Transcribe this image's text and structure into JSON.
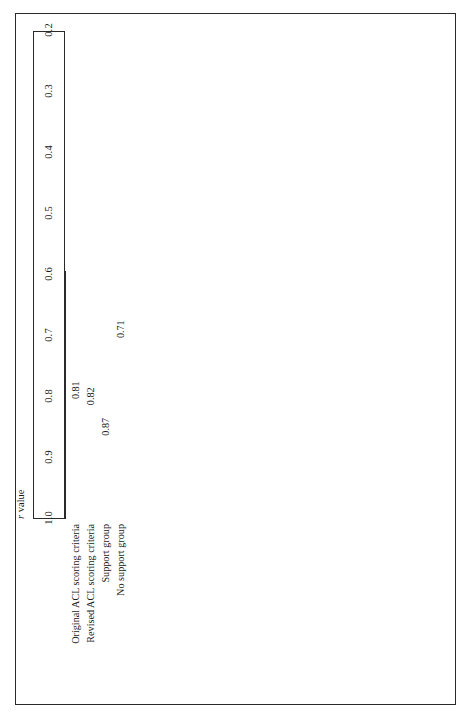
{
  "figure": {
    "orientation": "rotated-90-ccw",
    "background": "#ffffff",
    "frame_color": "#2a2a2a"
  },
  "chart_data": {
    "type": "bar",
    "title": "",
    "subtitle": "",
    "xlabel": "r value",
    "ylabel": "",
    "orientation": "horizontal",
    "categories": [
      "Original ACL scoring criteria",
      "Revised ACL scoring criteria",
      "Support group",
      "No support group"
    ],
    "values": [
      0.81,
      0.82,
      0.87,
      0.71
    ],
    "value_labels": [
      "0.81",
      "0.82",
      "0.87",
      "0.71"
    ],
    "xlim": [
      1.0,
      0.2
    ],
    "axis_reversed": true,
    "tick_labels": [
      "1.0",
      "0.9",
      "0.8",
      "0.7",
      "0.6",
      "0.5",
      "0.4",
      "0.3",
      "0.2"
    ],
    "tick_values": [
      1.0,
      0.9,
      0.8,
      0.7,
      0.6,
      0.5,
      0.4,
      0.3,
      0.2
    ],
    "grid": false,
    "legend": null,
    "bar_fill": "#ffffff",
    "bar_edge": "#ffffff",
    "text_color": "#1a1a1a"
  },
  "axis": {
    "title_r": "r",
    "title_value": " value"
  }
}
